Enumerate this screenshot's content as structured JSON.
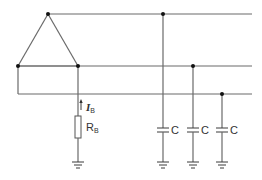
{
  "diagram": {
    "labels": {
      "current_symbol": "I",
      "current_subscript": "B",
      "resistor_symbol": "R",
      "resistor_subscript": "B",
      "capacitor_labels": [
        "C",
        "C",
        "C"
      ]
    }
  }
}
